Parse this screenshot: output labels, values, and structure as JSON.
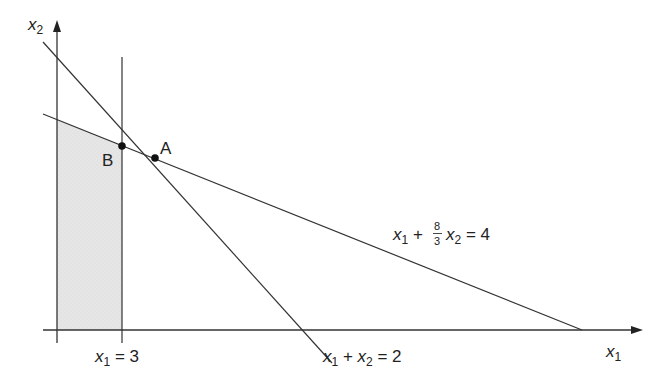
{
  "diagram": {
    "type": "linear-programming-feasible-region",
    "axes": {
      "x_label": "x",
      "x_sub": "1",
      "y_label": "x",
      "y_sub": "2"
    },
    "constraints": [
      {
        "id": "c1",
        "label_parts": [
          "x",
          "1",
          " = 3"
        ],
        "text": "x1 = 3"
      },
      {
        "id": "c2",
        "label_parts": [
          "x",
          "1",
          " + ",
          "x",
          "2",
          " = 2"
        ],
        "text": "x1 + x2 = 2"
      },
      {
        "id": "c3",
        "label_parts": [
          "x",
          "1",
          " + ",
          "8",
          "3",
          "x",
          "2",
          " = 4"
        ],
        "text": "x1 + (8/3)x2 = 4"
      }
    ],
    "points": [
      {
        "name": "A"
      },
      {
        "name": "B"
      }
    ],
    "colors": {
      "line": "#333333",
      "shade": "#e4e4e4",
      "point": "#111111"
    }
  }
}
